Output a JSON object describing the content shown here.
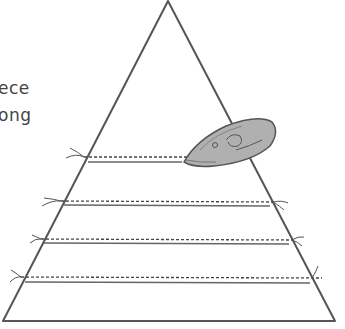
{
  "caption": {
    "line1": "ece",
    "line2": "ong"
  },
  "diagram": {
    "shape": "triangle",
    "seams": 4,
    "tool": "iron",
    "colors": {
      "outline": "#555555",
      "iron_fill": "#b0b0b0",
      "stitch": "#444444"
    }
  }
}
